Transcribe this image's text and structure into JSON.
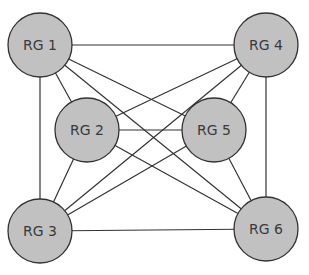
{
  "diagram": {
    "nodes": [
      {
        "id": "rg1",
        "label": "RG 1",
        "cx": 40,
        "cy": 45
      },
      {
        "id": "rg2",
        "label": "RG 2",
        "cx": 87,
        "cy": 130
      },
      {
        "id": "rg3",
        "label": "RG 3",
        "cx": 40,
        "cy": 231
      },
      {
        "id": "rg4",
        "label": "RG 4",
        "cx": 266,
        "cy": 45
      },
      {
        "id": "rg5",
        "label": "RG 5",
        "cx": 214,
        "cy": 130
      },
      {
        "id": "rg6",
        "label": "RG 6",
        "cx": 266,
        "cy": 229
      }
    ],
    "edges": [
      [
        "rg1",
        "rg4"
      ],
      [
        "rg1",
        "rg3"
      ],
      [
        "rg1",
        "rg2"
      ],
      [
        "rg1",
        "rg5"
      ],
      [
        "rg1",
        "rg6"
      ],
      [
        "rg4",
        "rg6"
      ],
      [
        "rg4",
        "rg2"
      ],
      [
        "rg4",
        "rg5"
      ],
      [
        "rg4",
        "rg3"
      ],
      [
        "rg3",
        "rg6"
      ],
      [
        "rg3",
        "rg2"
      ],
      [
        "rg3",
        "rg5"
      ],
      [
        "rg6",
        "rg2"
      ],
      [
        "rg6",
        "rg5"
      ],
      [
        "rg2",
        "rg5"
      ]
    ],
    "node_fill": "#c1c1c1",
    "stroke": "#333333"
  }
}
